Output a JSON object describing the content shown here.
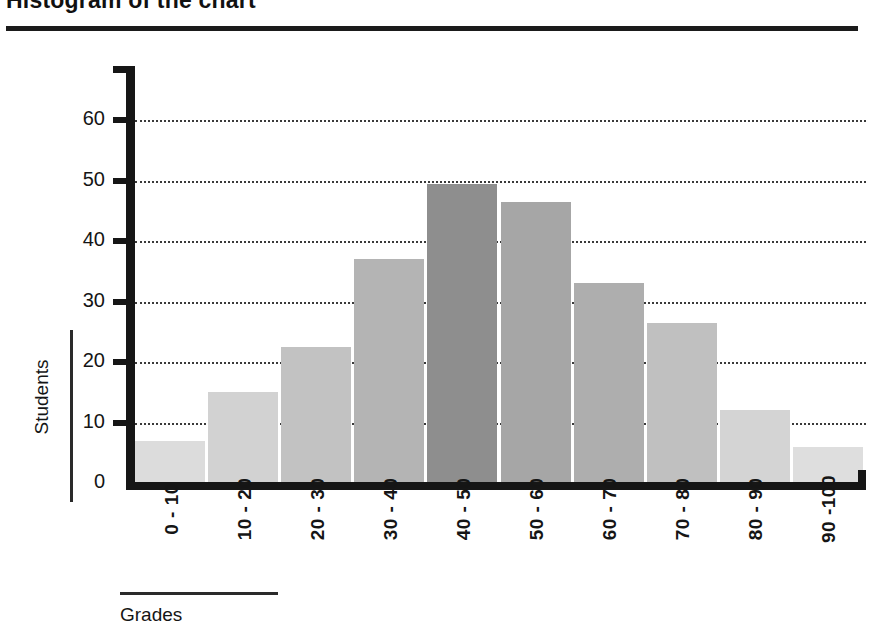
{
  "title": {
    "text": "Histogram of the chart",
    "note_clipped": true
  },
  "axis": {
    "ylabel": "Students",
    "xlabel": "Grades"
  },
  "chart_data": {
    "type": "bar",
    "title": "Histogram of the chart",
    "xlabel": "Grades",
    "ylabel": "Students",
    "ylim": [
      0,
      65
    ],
    "yticks": [
      0,
      10,
      20,
      30,
      40,
      50,
      60
    ],
    "ytick_labels": [
      "0",
      "10",
      "20",
      "30",
      "40",
      "50",
      "60"
    ],
    "grid": "horizontal-dotted",
    "legend": "none",
    "categories": [
      "0 - 10",
      "10 - 20",
      "20 - 30",
      "30 - 40",
      "40 - 50",
      "50 - 60",
      "60 - 70",
      "70 - 80",
      "80 - 90",
      "90 -100"
    ],
    "values": [
      7,
      15,
      22.5,
      37,
      49.5,
      46.5,
      33,
      26.5,
      12,
      6
    ],
    "bar_colors": [
      "#dcdcdc",
      "#d2d2d2",
      "#c2c2c2",
      "#b4b4b4",
      "#8e8e8e",
      "#a6a6a6",
      "#aeaeae",
      "#c0c0c0",
      "#d4d4d4",
      "#dedede"
    ]
  }
}
